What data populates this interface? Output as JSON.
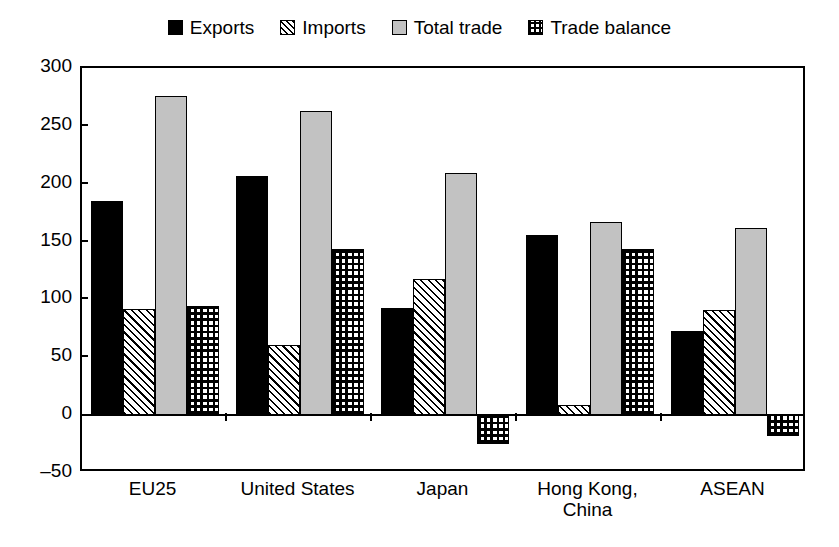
{
  "chart_data": {
    "type": "bar",
    "title": "",
    "subtitle": "",
    "xlabel": "",
    "ylabel": "",
    "ylim": [
      -50,
      300
    ],
    "yticks": [
      -50,
      0,
      50,
      100,
      150,
      200,
      250,
      300
    ],
    "ytick_labels": [
      "–50",
      "0",
      "50",
      "100",
      "150",
      "200",
      "250",
      "300"
    ],
    "grid": false,
    "legend_position": "top-center",
    "categories": [
      "EU25",
      "United States",
      "Japan",
      "Hong Kong, China",
      "ASEAN"
    ],
    "category_labels": [
      {
        "line1": "EU25",
        "line2": ""
      },
      {
        "line1": "United States",
        "line2": ""
      },
      {
        "line1": "Japan",
        "line2": ""
      },
      {
        "line1": "Hong Kong,",
        "line2": "China"
      },
      {
        "line1": "ASEAN",
        "line2": ""
      }
    ],
    "series": [
      {
        "name": "Exports",
        "pattern": "solid-black",
        "color": "#000000",
        "values": [
          185,
          207,
          93,
          156,
          73
        ]
      },
      {
        "name": "Imports",
        "pattern": "diagonal-hatch",
        "color": "#ffffff",
        "values": [
          92,
          61,
          118,
          9,
          91
        ]
      },
      {
        "name": "Total trade",
        "pattern": "solid-gray",
        "color": "#c2c2c2",
        "values": [
          276,
          263,
          209,
          167,
          162
        ]
      },
      {
        "name": "Trade balance",
        "pattern": "cross-hatch",
        "color": "#ffffff",
        "values": [
          94,
          144,
          -25,
          144,
          -18
        ]
      }
    ]
  },
  "legend": {
    "items": [
      {
        "label": "Exports"
      },
      {
        "label": "Imports"
      },
      {
        "label": "Total trade"
      },
      {
        "label": "Trade balance"
      }
    ]
  }
}
